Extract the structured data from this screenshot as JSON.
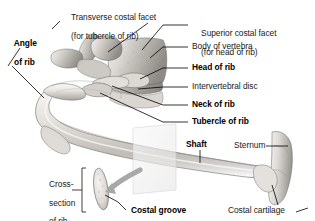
{
  "figure": {
    "background_color": "#ffffff",
    "bone_light": "#e8e6e2",
    "bone_mid": "#c9c5bf",
    "bone_shadow": "#8d8a85",
    "outline_color": "#6f6c68",
    "leader_color": "#000000",
    "plane_fill": "#f2f2f2",
    "arrow_color": "#a8a8a8"
  },
  "labels": {
    "transverse_costal_facet": {
      "line1": "Transverse costal facet",
      "line2": "(for tubercle of rib)",
      "bold": false
    },
    "angle_of_rib": {
      "line1": "Angle",
      "line2": "of rib",
      "bold": true
    },
    "superior_costal_facet": {
      "line1": "Superior costal facet",
      "line2": "(for head of rib)",
      "bold": false
    },
    "body_of_vertebra": {
      "line1": "Body of vertebra",
      "bold": false
    },
    "head_of_rib": {
      "line1": "Head of rib",
      "bold": true
    },
    "intervertebral_disc": {
      "line1": "Intervertebral disc",
      "bold": false
    },
    "neck_of_rib": {
      "line1": "Neck of rib",
      "bold": true
    },
    "tubercle_of_rib": {
      "line1": "Tubercle of rib",
      "bold": true
    },
    "shaft": {
      "line1": "Shaft",
      "bold": true
    },
    "sternum": {
      "line1": "Sternum",
      "bold": false
    },
    "costal_cartilage": {
      "line1": "Costal cartilage",
      "bold": false
    },
    "costal_groove": {
      "line1": "Costal groove",
      "bold": true
    },
    "cross_section_of_rib": {
      "line1": "Cross-",
      "line2": "section",
      "line3": "of rib",
      "bold": false
    }
  }
}
